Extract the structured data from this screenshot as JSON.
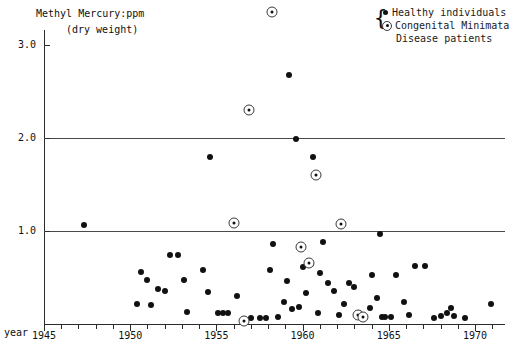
{
  "chart_data": {
    "type": "scatter",
    "title": "Methyl Mercury:ppm",
    "subtitle": "(dry weight)",
    "xlabel": "year",
    "ylabel": "Methyl Mercury:ppm (dry weight)",
    "xlim": [
      1944.2,
      1971.9
    ],
    "ylim": [
      0,
      3.45
    ],
    "grid": "horizontal gridlines at 1.0 and 2.0",
    "legend_position": "top-right",
    "y_ticks": [
      "1.0",
      "2.0",
      "3.0"
    ],
    "y_tick_values": [
      1.0,
      2.0,
      3.0
    ],
    "x_ticks": [
      "1945",
      "1950",
      "1955",
      "1960",
      "1965",
      "1970"
    ],
    "x_tick_values": [
      1945,
      1950,
      1955,
      1960,
      1965,
      1970
    ],
    "x_minor_tick_step": 1,
    "series": [
      {
        "name": "Healthy individuals",
        "marker": "filled-circle",
        "points": [
          [
            1947.3,
            1.06
          ],
          [
            1950.4,
            0.22
          ],
          [
            1951.2,
            0.2
          ],
          [
            1951.0,
            0.47
          ],
          [
            1951.6,
            0.38
          ],
          [
            1950.6,
            0.56
          ],
          [
            1952.3,
            0.74
          ],
          [
            1952.8,
            0.74
          ],
          [
            1952.0,
            0.36
          ],
          [
            1953.3,
            0.13
          ],
          [
            1954.6,
            1.8
          ],
          [
            1954.2,
            0.58
          ],
          [
            1954.5,
            0.34
          ],
          [
            1955.1,
            0.12
          ],
          [
            1955.4,
            0.12
          ],
          [
            1955.7,
            0.12
          ],
          [
            1956.2,
            0.3
          ],
          [
            1956.6,
            0.05
          ],
          [
            1957.0,
            0.06
          ],
          [
            1957.5,
            0.06
          ],
          [
            1957.9,
            0.06
          ],
          [
            1958.3,
            0.86
          ],
          [
            1958.1,
            0.58
          ],
          [
            1958.6,
            0.07
          ],
          [
            1958.9,
            0.24
          ],
          [
            1959.1,
            0.46
          ],
          [
            1959.2,
            2.68
          ],
          [
            1959.6,
            1.99
          ],
          [
            1959.4,
            0.16
          ],
          [
            1959.8,
            0.18
          ],
          [
            1960.0,
            0.61
          ],
          [
            1960.2,
            0.33
          ],
          [
            1960.6,
            1.8
          ],
          [
            1960.5,
            0.64
          ],
          [
            1960.9,
            0.12
          ],
          [
            1961.2,
            0.88
          ],
          [
            1961.0,
            0.55
          ],
          [
            1961.5,
            0.44
          ],
          [
            1961.8,
            0.35
          ],
          [
            1962.1,
            0.1
          ],
          [
            1962.4,
            0.22
          ],
          [
            1962.7,
            0.44
          ],
          [
            1963.0,
            0.4
          ],
          [
            1963.3,
            0.12
          ],
          [
            1963.9,
            0.17
          ],
          [
            1963.6,
            0.07
          ],
          [
            1964.5,
            0.97
          ],
          [
            1964.0,
            0.53
          ],
          [
            1964.3,
            0.28
          ],
          [
            1964.6,
            0.08
          ],
          [
            1964.8,
            0.08
          ],
          [
            1965.1,
            0.08
          ],
          [
            1965.4,
            0.53
          ],
          [
            1965.9,
            0.24
          ],
          [
            1966.2,
            0.1
          ],
          [
            1966.5,
            0.62
          ],
          [
            1967.1,
            0.62
          ],
          [
            1967.6,
            0.06
          ],
          [
            1968.0,
            0.09
          ],
          [
            1968.4,
            0.12
          ],
          [
            1968.6,
            0.17
          ],
          [
            1968.8,
            0.09
          ],
          [
            1969.4,
            0.06
          ],
          [
            1970.9,
            0.22
          ],
          [
            1953.1,
            0.47
          ]
        ]
      },
      {
        "name": "Congenital Minimata Disease patients",
        "marker": "circle-dot",
        "points": [
          [
            1958.2,
            3.35
          ],
          [
            1956.9,
            2.3
          ],
          [
            1956.0,
            1.09
          ],
          [
            1960.8,
            1.6
          ],
          [
            1962.2,
            1.08
          ],
          [
            1956.6,
            0.03
          ],
          [
            1959.9,
            0.83
          ],
          [
            1960.4,
            0.66
          ],
          [
            1963.2,
            0.1
          ],
          [
            1963.5,
            0.07
          ]
        ]
      }
    ]
  },
  "legend": {
    "brace": "{",
    "entries": [
      {
        "label": "Healthy individuals",
        "marker": "filled-circle"
      },
      {
        "label": "Congenital Minimata",
        "marker": "circle-dot"
      }
    ],
    "continuation": "Disease patients"
  },
  "axes": {
    "year_label": "year"
  }
}
